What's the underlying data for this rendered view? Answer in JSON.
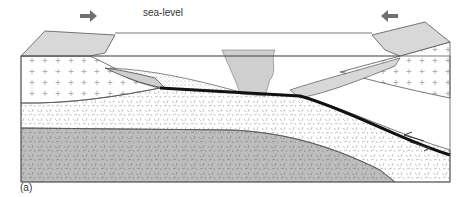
{
  "diagram": {
    "type": "geological cross-section",
    "labels": {
      "sea_level": "sea-level",
      "figure": "(a)"
    },
    "arrows": [
      {
        "name": "left-convergence-arrow",
        "direction": "right"
      },
      {
        "name": "right-convergence-arrow",
        "direction": "left"
      },
      {
        "name": "fault-slip-arrows",
        "direction": "opposing"
      }
    ],
    "layers": [
      "continental-crust-left",
      "continental-crust-right",
      "foreland-basin-sediment",
      "accretionary-wedge",
      "subducting-slab-fault",
      "oceanic-crust",
      "mantle"
    ],
    "colors": {
      "land": "#d8d8d8",
      "mantle": "#bdbdbd",
      "outline": "#555555",
      "fault": "#111111",
      "arrow": "#707070"
    }
  }
}
